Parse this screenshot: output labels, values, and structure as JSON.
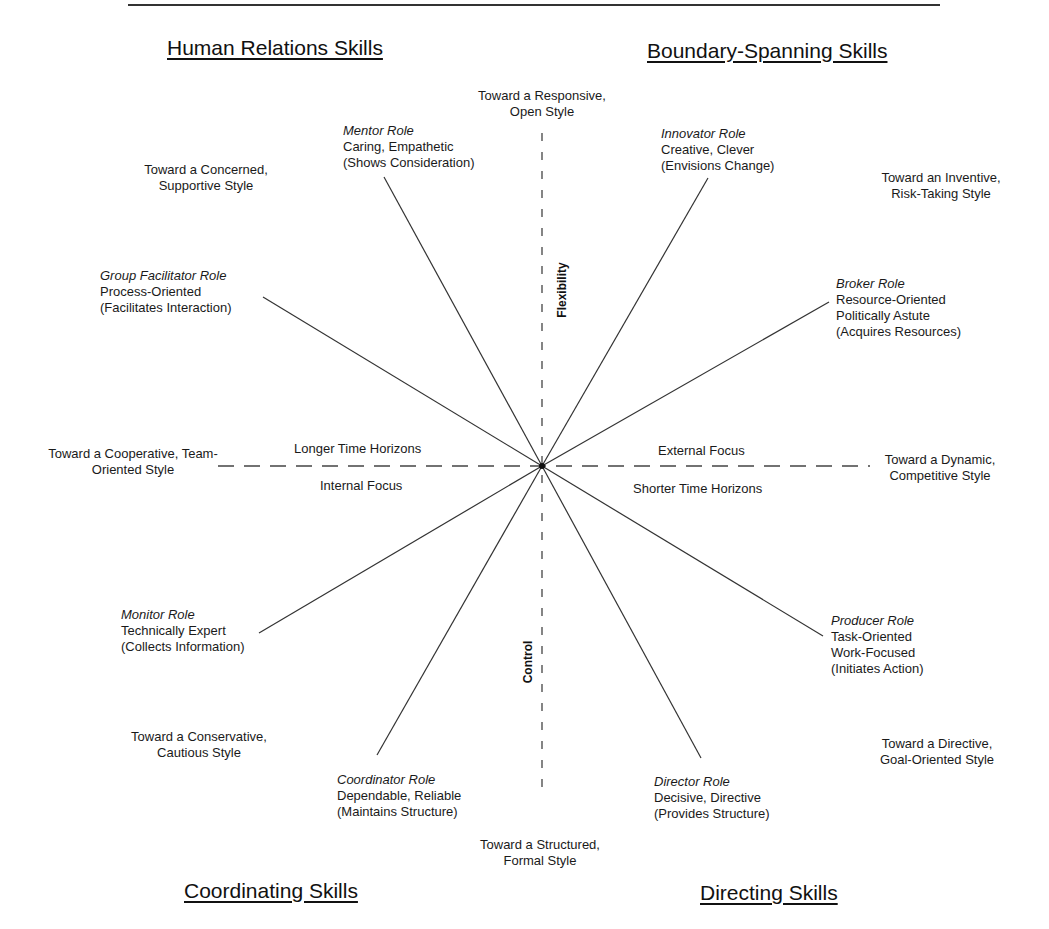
{
  "quadrants": {
    "top_left": "Human Relations Skills",
    "top_right": "Boundary-Spanning Skills",
    "bottom_left": "Coordinating Skills",
    "bottom_right": "Directing Skills"
  },
  "axes": {
    "vertical_top_label": "Flexibility",
    "vertical_bottom_label": "Control",
    "horizontal_left_above": "Longer Time Horizons",
    "horizontal_left_below": "Internal Focus",
    "horizontal_right_above": "External Focus",
    "horizontal_right_below": "Shorter Time Horizons"
  },
  "styles": {
    "top": [
      "Toward a Responsive,",
      "Open Style"
    ],
    "top_left": [
      "Toward a Concerned,",
      "Supportive Style"
    ],
    "top_right": [
      "Toward an Inventive,",
      "Risk-Taking Style"
    ],
    "left": [
      "Toward a Cooperative, Team-",
      "Oriented Style"
    ],
    "right": [
      "Toward a Dynamic,",
      "Competitive Style"
    ],
    "bottom_left": [
      "Toward a Conservative,",
      "Cautious Style"
    ],
    "bottom_right": [
      "Toward a Directive,",
      "Goal-Oriented Style"
    ],
    "bottom": [
      "Toward a Structured,",
      "Formal Style"
    ]
  },
  "roles": {
    "mentor": {
      "name": "Mentor Role",
      "lines": [
        "Caring, Empathetic",
        "(Shows Consideration)"
      ]
    },
    "innovator": {
      "name": "Innovator Role",
      "lines": [
        "Creative, Clever",
        "(Envisions Change)"
      ]
    },
    "group_facilitator": {
      "name": "Group Facilitator Role",
      "lines": [
        "Process-Oriented",
        "(Facilitates Interaction)"
      ]
    },
    "broker": {
      "name": "Broker Role",
      "lines": [
        "Resource-Oriented",
        "Politically Astute",
        "(Acquires Resources)"
      ]
    },
    "monitor": {
      "name": "Monitor Role",
      "lines": [
        "Technically Expert",
        "(Collects Information)"
      ]
    },
    "producer": {
      "name": "Producer Role",
      "lines": [
        "Task-Oriented",
        "Work-Focused",
        "(Initiates Action)"
      ]
    },
    "coordinator": {
      "name": "Coordinator Role",
      "lines": [
        "Dependable, Reliable",
        "(Maintains Structure)"
      ]
    },
    "director": {
      "name": "Director Role",
      "lines": [
        "Decisive, Directive",
        "(Provides Structure)"
      ]
    }
  },
  "geometry": {
    "center": [
      542,
      466
    ],
    "spokes": {
      "mentor": [
        384,
        177
      ],
      "innovator": [
        708,
        178
      ],
      "group_facilitator": [
        263,
        297
      ],
      "broker": [
        829,
        302
      ],
      "monitor": [
        259,
        633
      ],
      "producer": [
        823,
        636
      ],
      "coordinator": [
        377,
        755
      ],
      "director": [
        701,
        758
      ]
    },
    "h_axis": [
      218,
      870
    ],
    "v_axis": [
      133,
      797
    ],
    "top_rule": [
      128,
      940,
      5
    ]
  },
  "colors": {
    "line": "#333333",
    "text": "#1a1a1a"
  }
}
